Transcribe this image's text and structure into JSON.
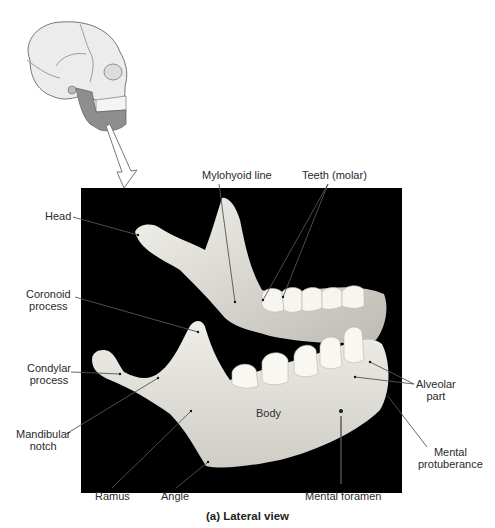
{
  "figure": {
    "caption": "(a) Lateral view"
  },
  "labels": {
    "head": "Head",
    "coronoid_process_1": "Coronoid",
    "coronoid_process_2": "process",
    "condylar_process_1": "Condylar",
    "condylar_process_2": "process",
    "mandibular_notch_1": "Mandibular",
    "mandibular_notch_2": "notch",
    "mylohyoid_line": "Mylohyoid line",
    "teeth_molar": "Teeth (molar)",
    "alveolar_part_1": "Alveolar",
    "alveolar_part_2": "part",
    "mental_protuberance_1": "Mental",
    "mental_protuberance_2": "protuberance",
    "body": "Body",
    "ramus": "Ramus",
    "angle": "Angle",
    "mental_foramen": "Mental foramen"
  },
  "colors": {
    "bone": "#e8e6e0",
    "background": "#000000",
    "leader_line": "#555555",
    "highlight_mandible": "#8a8a8a"
  }
}
